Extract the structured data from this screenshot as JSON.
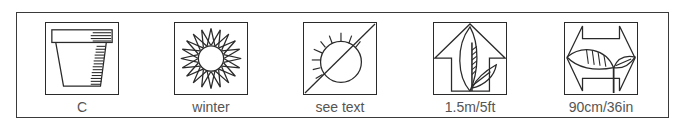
{
  "legend": {
    "items": [
      {
        "icon": "pot-icon",
        "label": "C"
      },
      {
        "icon": "flower-icon",
        "label": "winter"
      },
      {
        "icon": "sun-icon",
        "label": "see text"
      },
      {
        "icon": "height-icon",
        "label": "1.5m/5ft"
      },
      {
        "icon": "spread-icon",
        "label": "90cm/36in"
      }
    ]
  },
  "colors": {
    "stroke": "#2a2a2a",
    "label": "#555555",
    "background": "#ffffff"
  }
}
